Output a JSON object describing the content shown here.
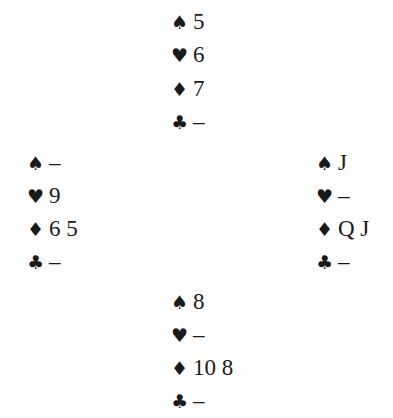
{
  "hands": {
    "north": {
      "spades": "5",
      "hearts": "6",
      "diamonds": "7",
      "clubs": "–"
    },
    "west": {
      "spades": "–",
      "hearts": "9",
      "diamonds": "6 5",
      "clubs": "–"
    },
    "east": {
      "spades": "J",
      "hearts": "–",
      "diamonds": "Q J",
      "clubs": "–"
    },
    "south": {
      "spades": "8",
      "hearts": "–",
      "diamonds": "10 8",
      "clubs": "–"
    }
  },
  "suit_symbols": {
    "spades": "♠",
    "hearts": "♥",
    "diamonds": "♦",
    "clubs": "♣"
  }
}
